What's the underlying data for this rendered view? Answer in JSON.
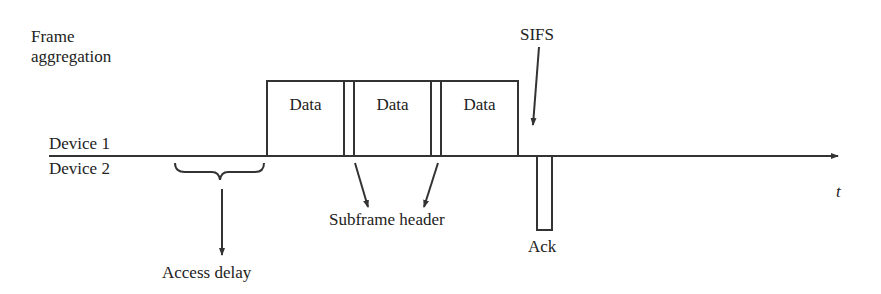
{
  "diagram": {
    "title_line1": "Frame",
    "title_line2": "aggregation",
    "devices": [
      "Device 1",
      "Device 2"
    ],
    "time_axis_label": "t",
    "data_frames": [
      {
        "label": "Data"
      },
      {
        "label": "Data"
      },
      {
        "label": "Data"
      }
    ],
    "annotations": {
      "sifs": "SIFS",
      "subframe_header": "Subframe header",
      "access_delay": "Access delay",
      "ack": "Ack"
    },
    "colors": {
      "stroke": "#333333",
      "background": "#ffffff"
    }
  }
}
